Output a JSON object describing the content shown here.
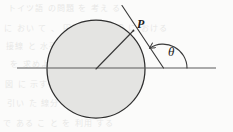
{
  "figure": {
    "name": "circle-tangent-angle-diagram",
    "labels": {
      "point_p": "P",
      "angle_theta": "θ"
    },
    "background_text": [
      "トイツ語 の問題 を 考え る",
      "に おい て 、 円周 上 の点 P に おける",
      "接線 と 水平線 の なす 角 θ",
      "を 求めよ。 半径 は r と する 。",
      "図 に 示す よう に 、 中心 から",
      "引い た 線分 は 接線 に 垂直",
      "で ある こ と を 利用 する"
    ],
    "colors": {
      "stroke": "#3a3a3a",
      "circle_fill": "#e4e4e2",
      "circle_stroke": "#2e2e2e",
      "baseline": "#5a5a5a",
      "label": "#1d1d1d",
      "background": "#fbfbfa"
    },
    "geometry": {
      "circle": {
        "cx": 96,
        "cy": 69,
        "r": 49
      },
      "baseline": {
        "x1": 17,
        "y1": 68,
        "x2": 216,
        "y2": 68
      },
      "radius_line": {
        "x1": 96,
        "y1": 69,
        "x2": 133,
        "y2": 31
      },
      "tangent_line": {
        "x1": 122,
        "y1": 6,
        "x2": 163,
        "y2": 68
      },
      "angle_arc": {
        "cx": 163,
        "cy": 68,
        "r": 24,
        "start_deg": 0,
        "end_deg": 124
      },
      "arrow_tip": {
        "x": 142,
        "y": 46
      },
      "point_p": {
        "x": 133,
        "y": 31
      }
    }
  }
}
